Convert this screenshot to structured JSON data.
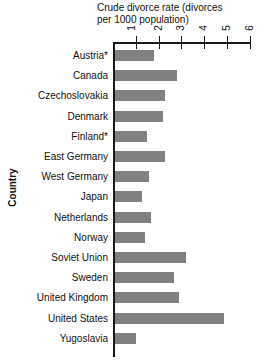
{
  "chart_data": {
    "type": "bar",
    "orientation": "horizontal",
    "title": "Crude divorce rate (divorces per 1000 population)",
    "title_line1": "Crude divorce rate (divorces",
    "title_line2": "per 1000 population)",
    "xlabel": "Crude divorce rate (divorces per 1000 population)",
    "ylabel": "Country",
    "xlim": [
      0,
      6
    ],
    "xticks": [
      1,
      2,
      3,
      4,
      5,
      6
    ],
    "xtick_labels": [
      "1",
      "2",
      "3",
      "4",
      "5",
      "6"
    ],
    "grid": false,
    "legend": false,
    "bar_color": "#808080",
    "axis_color": "#1a1a1a",
    "categories": [
      "Austria*",
      "Canada",
      "Czechoslovakia",
      "Denmark",
      "Finland*",
      "East Germany",
      "West Germany",
      "Japan",
      "Netherlands",
      "Norway",
      "Soviet Union",
      "Sweden",
      "United Kingdom",
      "United States",
      "Yugoslavia"
    ],
    "values": [
      1.7,
      2.7,
      2.2,
      2.1,
      1.4,
      2.2,
      1.5,
      1.2,
      1.6,
      1.3,
      3.1,
      2.6,
      2.8,
      4.8,
      0.9
    ]
  }
}
